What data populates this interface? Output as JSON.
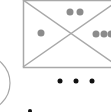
{
  "diagram": {
    "colors": {
      "line": "#a8a8a8",
      "grey_dot": "#8c8c8c",
      "black_dot": "#111111",
      "background": "#ffffff"
    },
    "rectangle": {
      "x": 23,
      "y": 0,
      "width": 96,
      "height": 67
    },
    "diagonals": [
      {
        "x1": 23,
        "y1": 0,
        "x2": 119,
        "y2": 67
      },
      {
        "x1": 23,
        "y1": 67,
        "x2": 119,
        "y2": 0
      }
    ],
    "grey_dots": [
      {
        "cx": 41,
        "cy": 33,
        "r": 3.5
      },
      {
        "cx": 70,
        "cy": 12,
        "r": 3.5
      },
      {
        "cx": 80,
        "cy": 12,
        "r": 3.5
      },
      {
        "cx": 96,
        "cy": 34,
        "r": 3.5
      },
      {
        "cx": 104,
        "cy": 34,
        "r": 3.5
      },
      {
        "cx": 111,
        "cy": 34,
        "r": 3.5
      }
    ],
    "ellipsis_dots": [
      {
        "cx": 60,
        "cy": 81,
        "r": 2.5
      },
      {
        "cx": 76,
        "cy": 81,
        "r": 2.5
      },
      {
        "cx": 92,
        "cy": 81,
        "r": 2.5
      }
    ],
    "arc": {
      "cx": -18,
      "cy": 83,
      "rx": 28,
      "ry": 28
    },
    "bottom_dot": {
      "cx": 30,
      "cy": 111,
      "r": 2
    }
  }
}
